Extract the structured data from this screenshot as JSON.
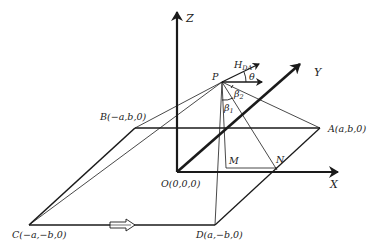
{
  "figure": {
    "type": "3D geometry diagram",
    "colors": {
      "line": "#1a1a1a",
      "background": "#ffffff"
    },
    "axes": {
      "z": {
        "label": "Z"
      },
      "x": {
        "label": "X"
      },
      "y": {
        "label": "Y"
      }
    },
    "points": {
      "origin": {
        "label": "O(0,0,0)"
      },
      "A": {
        "label": "A(a,b,0)"
      },
      "B": {
        "label": "B(−a,b,0)"
      },
      "C": {
        "label": "C(−a,−b,0)"
      },
      "D": {
        "label": "D(a,−b,0)"
      },
      "P": {
        "label": "P"
      },
      "M": {
        "label": "M"
      },
      "N": {
        "label": "N"
      }
    },
    "vectors": {
      "h_da": {
        "label_main": "H",
        "label_sub": "DA"
      }
    },
    "angles": {
      "theta": "θ",
      "beta1_main": "β",
      "beta1_sub": "1",
      "beta2_main": "β",
      "beta2_sub": "2"
    },
    "direction_arrow": {
      "description": "hollow arrow along edge C→D"
    }
  }
}
